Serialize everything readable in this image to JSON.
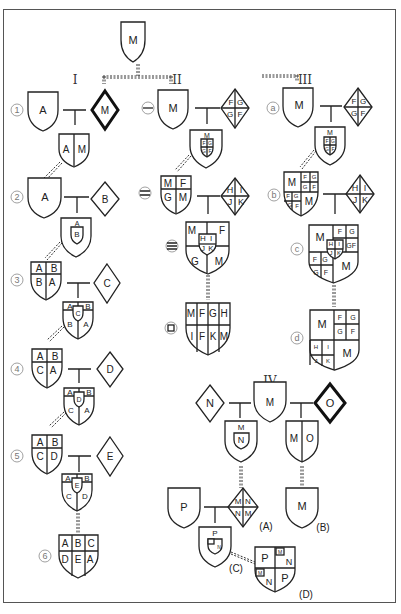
{
  "diagram": {
    "root": {
      "label": "M"
    },
    "sections": [
      {
        "id": "I",
        "label": "I"
      },
      {
        "id": "II",
        "label": "II"
      },
      {
        "id": "III",
        "label": "III"
      },
      {
        "id": "IV",
        "label": "IV"
      }
    ],
    "column_I": {
      "steps": [
        {
          "num": "①",
          "husband": "A",
          "wife": "M",
          "child": [
            "A",
            "M"
          ]
        },
        {
          "num": "②",
          "husband": "A",
          "wife": "B",
          "child_top": "A",
          "child_inner": "B"
        },
        {
          "num": "③",
          "husband": [
            "A",
            "B",
            "B",
            "A"
          ],
          "wife": "C",
          "child": [
            "A",
            "B",
            "C",
            "B",
            "A"
          ]
        },
        {
          "num": "④",
          "husband": [
            "A",
            "B",
            "C",
            "A"
          ],
          "wife": "D",
          "child": [
            "A",
            "B",
            "D",
            "C",
            "A"
          ]
        },
        {
          "num": "⑤",
          "husband": [
            "A",
            "B",
            "C",
            "D"
          ],
          "wife": "E",
          "child": [
            "A",
            "B",
            "E",
            "C",
            "D"
          ]
        },
        {
          "num": "⑥",
          "result": [
            "A",
            "B",
            "C",
            "D",
            "E",
            "A"
          ]
        }
      ]
    },
    "column_II": {
      "steps": [
        {
          "num": "㊀",
          "husband": "M",
          "wife": [
            "F",
            "G",
            "G",
            "F"
          ],
          "child_top": "M",
          "child_inner": [
            "F",
            "G",
            "G",
            "F"
          ]
        },
        {
          "num": "㊁",
          "husband": [
            "M",
            "F",
            "G",
            "M"
          ],
          "wife": [
            "H",
            "I",
            "J",
            "K"
          ],
          "child": [
            "M",
            "F",
            "G",
            "M"
          ],
          "child_inner": [
            "H",
            "I",
            "J",
            "K"
          ]
        },
        {
          "num": "㊂",
          "result": [
            "M",
            "F",
            "G",
            "H",
            "I",
            "F",
            "K",
            "M"
          ]
        }
      ]
    },
    "column_III": {
      "steps": [
        {
          "num": "ⓐ",
          "husband": "M",
          "wife": [
            "F",
            "G",
            "G",
            "F"
          ],
          "child_top": "M",
          "child_inner": [
            "F",
            "G",
            "G",
            "F"
          ]
        },
        {
          "num": "ⓑ",
          "husband": [
            "M",
            "F",
            "G",
            "G",
            "F",
            "F",
            "G",
            "G",
            "F",
            "M"
          ],
          "wife": [
            "H",
            "I",
            "J",
            "K"
          ]
        },
        {
          "num": "ⓒ",
          "result": [
            "M",
            "F",
            "G",
            "H",
            "I",
            "G",
            "F",
            "F",
            "G",
            "J",
            "K",
            "G",
            "F",
            "M"
          ]
        },
        {
          "num": "ⓓ",
          "result": [
            "M",
            "F",
            "G",
            "G",
            "F",
            "H",
            "I",
            "J",
            "K",
            "M"
          ]
        }
      ]
    },
    "column_IV": {
      "wife_left": "N",
      "center": "M",
      "wife_right": "O",
      "child_left": {
        "top": "M",
        "inner": "N"
      },
      "child_right": [
        "M",
        "O"
      ],
      "A": {
        "label": "(A)",
        "cells": [
          "M",
          "N",
          "N",
          "M"
        ]
      },
      "B": {
        "label": "(B)",
        "value": "M"
      },
      "P": "P",
      "C": {
        "label": "(C)",
        "top": "P",
        "inner": [
          "M",
          "N"
        ]
      },
      "D": {
        "label": "(D)",
        "cells": [
          "P",
          "M",
          "N",
          "M",
          "N",
          "P"
        ]
      }
    }
  }
}
